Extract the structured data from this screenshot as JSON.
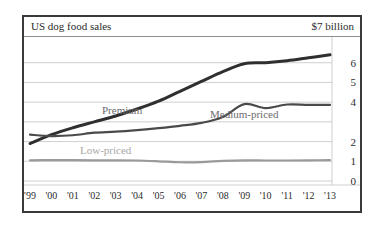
{
  "header": {
    "title": "US dog food sales",
    "unit_note": "$7 billion"
  },
  "series_labels": {
    "premium": "Premium",
    "medium": "Medium-priced",
    "low": "Low-priced"
  },
  "colors": {
    "frame": "#3a3a3a",
    "gridline": "#c9c9c9",
    "premium_line": "#2f2f2f",
    "medium_line": "#4a4a4a",
    "low_line": "#9a9a9a",
    "premium_label": "#6b6b6b",
    "medium_label": "#6b6b6b",
    "low_label": "#a8a8a8",
    "tick_text": "#2b2b2b",
    "background": "#ffffff"
  },
  "chart_data": {
    "type": "line",
    "title": "US dog food sales",
    "subtitle": "$7 billion",
    "xlabel": "",
    "ylabel": "",
    "ylim": [
      0,
      7
    ],
    "xlim": [
      "'99",
      "'13"
    ],
    "grid": true,
    "legend": "inline-labels",
    "ytick_values": [
      0,
      1,
      2,
      3,
      4,
      5,
      6
    ],
    "ytick_labels": [
      "0",
      "1",
      "2",
      "",
      "4",
      "5",
      "6"
    ],
    "x": [
      "'99",
      "'00",
      "'01",
      "'02",
      "'03",
      "'04",
      "'05",
      "'06",
      "'07",
      "'08",
      "'09",
      "'10",
      "'11",
      "'12",
      "'13"
    ],
    "series": [
      {
        "name": "Premium",
        "color": "#2f2f2f",
        "values": [
          1.9,
          2.35,
          2.7,
          3.0,
          3.3,
          3.65,
          4.05,
          4.55,
          5.05,
          5.55,
          5.95,
          6.0,
          6.1,
          6.25,
          6.4
        ]
      },
      {
        "name": "Medium-priced",
        "color": "#4a4a4a",
        "values": [
          2.35,
          2.28,
          2.32,
          2.45,
          2.5,
          2.58,
          2.68,
          2.8,
          2.95,
          3.25,
          3.9,
          3.7,
          3.88,
          3.86,
          3.86
        ]
      },
      {
        "name": "Low-priced",
        "color": "#9a9a9a",
        "values": [
          1.05,
          1.06,
          1.06,
          1.05,
          1.05,
          1.04,
          1.0,
          0.95,
          0.96,
          1.02,
          1.05,
          1.04,
          1.04,
          1.05,
          1.06
        ]
      }
    ]
  }
}
